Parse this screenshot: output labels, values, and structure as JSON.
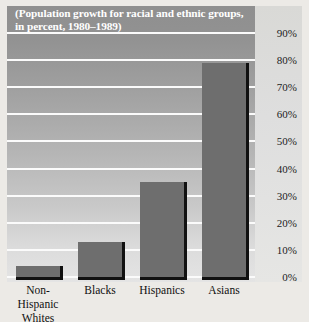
{
  "chart_data": {
    "type": "bar",
    "title": "(Population growth for racial and ethnic groups, in percent, 1980–1989)",
    "xlabel": "",
    "ylabel": "",
    "categories": [
      "Non-Hispanic Whites",
      "Blacks",
      "Hispanics",
      "Asians"
    ],
    "values": [
      4,
      13,
      35,
      79
    ],
    "ylim": [
      0,
      90
    ],
    "yticks": [
      "0%",
      "10%",
      "20%",
      "30%",
      "40%",
      "50%",
      "60%",
      "70%",
      "80%",
      "90%"
    ],
    "ytick_values": [
      0,
      10,
      20,
      30,
      40,
      50,
      60,
      70,
      80,
      90
    ],
    "grid": true,
    "legend": false,
    "legend_position": "none",
    "bar_color": "#6e6e6e",
    "bar_shadow_color": "#111111",
    "gridline_color": "#fbfbfb",
    "title_color": "#ffffff",
    "tick_color": "#1c1c1c"
  }
}
